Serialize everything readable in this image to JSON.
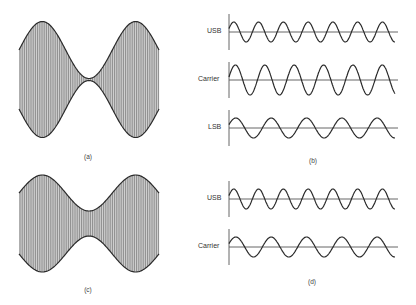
{
  "figure": {
    "panels": [
      {
        "id": "a",
        "caption": "(a)",
        "type": "am-envelope",
        "modulation": "100% (envelopes touch at center)"
      },
      {
        "id": "b",
        "caption": "(b)",
        "type": "components",
        "traces": [
          {
            "label": "USB",
            "cycles": 7,
            "amplitude": "small"
          },
          {
            "label": "Carrier",
            "cycles": 6,
            "amplitude": "large"
          },
          {
            "label": "LSB",
            "cycles": 5,
            "amplitude": "small"
          }
        ]
      },
      {
        "id": "c",
        "caption": "(c)",
        "type": "am-envelope",
        "modulation": "partial (envelope neck does not close)"
      },
      {
        "id": "d",
        "caption": "(d)",
        "type": "components",
        "traces": [
          {
            "label": "USB",
            "cycles": 7,
            "amplitude": "small"
          },
          {
            "label": "Carrier",
            "cycles": 5,
            "amplitude": "small"
          }
        ]
      }
    ]
  },
  "labels": {
    "b_usb": "USB",
    "b_carrier": "Carrier",
    "b_lsb": "LSB",
    "d_usb": "USB",
    "d_carrier": "Carrier",
    "cap_a": "(a)",
    "cap_b": "(b)",
    "cap_c": "(c)",
    "cap_d": "(d)"
  },
  "colors": {
    "line": "#2a2a2a",
    "fill": "#cfcfcf",
    "hatch": "#555555",
    "axis": "#555555"
  }
}
